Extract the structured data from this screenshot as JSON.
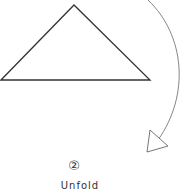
{
  "diagram": {
    "step_marker": "②",
    "caption": "Unfold",
    "colors": {
      "stroke": "#333333",
      "arrow": "#666666",
      "background": "#ffffff"
    }
  }
}
